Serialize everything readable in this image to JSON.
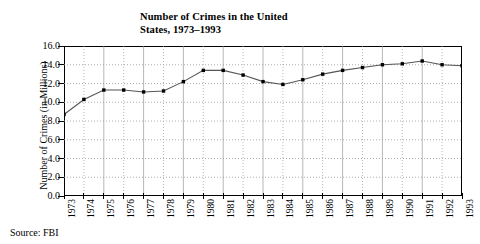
{
  "chart_data": {
    "type": "line",
    "title": "Number of Crimes in the United States, 1973–1993",
    "title_line1": "Number of Crimes in the United",
    "title_line2": "States, 1973–1993",
    "xlabel": "",
    "ylabel": "Number of Crimes (in Millions)",
    "ylim": [
      0.0,
      16.0
    ],
    "ytick_labels": [
      "0.0",
      "2.0",
      "4.0",
      "6.0",
      "8.0",
      "10.0",
      "12.0",
      "14.0",
      "16.0"
    ],
    "ytick_values": [
      0.0,
      2.0,
      4.0,
      6.0,
      8.0,
      10.0,
      12.0,
      14.0,
      16.0
    ],
    "grid": true,
    "grid_style": "dotted",
    "legend": "none",
    "marker": "filled-square",
    "line_color": "#555555",
    "marker_color": "#000000",
    "categories": [
      "1973",
      "1974",
      "1975",
      "1976",
      "1977",
      "1978",
      "1979",
      "1980",
      "1981",
      "1982",
      "1983",
      "1984",
      "1985",
      "1986",
      "1987",
      "1988",
      "1989",
      "1990",
      "1991",
      "1992",
      "1993"
    ],
    "x": [
      1973,
      1974,
      1975,
      1976,
      1977,
      1978,
      1979,
      1980,
      1981,
      1982,
      1983,
      1984,
      1985,
      1986,
      1987,
      1988,
      1989,
      1990,
      1991,
      1992,
      1993
    ],
    "values": [
      8.7,
      10.3,
      11.3,
      11.3,
      11.1,
      11.2,
      12.2,
      13.4,
      13.4,
      12.9,
      12.2,
      11.9,
      12.4,
      13.0,
      13.4,
      13.7,
      14.0,
      14.1,
      14.4,
      14.0,
      13.9
    ],
    "annotations": []
  },
  "source": {
    "label": "Source: FBI"
  }
}
